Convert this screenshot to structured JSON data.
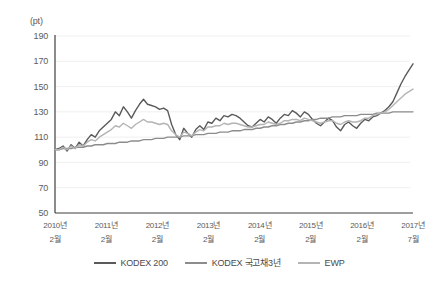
{
  "chart_data": {
    "type": "line",
    "title": "",
    "subtitle": "",
    "unit_label": "(pt)",
    "xlabel": "",
    "ylabel": "",
    "ylim": [
      50,
      190
    ],
    "y_ticks": [
      190,
      170,
      150,
      130,
      110,
      90,
      70,
      50
    ],
    "grid": true,
    "legend_position": "bottom",
    "x_tick_labels": [
      "2010년\n2월",
      "2011년\n2월",
      "2012년\n2월",
      "2013년\n2월",
      "2014년\n2월",
      "2015년\n2월",
      "2016년\n2월",
      "2017년\n7월"
    ],
    "x_ticks_line1": [
      "2010년",
      "2011년",
      "2012년",
      "2013년",
      "2014년",
      "2015년",
      "2016년",
      "2017년"
    ],
    "x_ticks_line2": [
      "2월",
      "2월",
      "2월",
      "2월",
      "2월",
      "2월",
      "2월",
      "7월"
    ],
    "x_start": "2010-02",
    "x_end": "2017-07",
    "n_points": 90,
    "colors": {
      "kodex200": "#5a5a5a",
      "kodex_bond3y": "#8c8c8c",
      "ewp": "#b4b4b4",
      "grid": "#efefef",
      "axis": "#3f3f3f",
      "text": "#5b5b5b"
    },
    "series": [
      {
        "name": "KODEX 200",
        "color": "#5a5a5a",
        "values": [
          100,
          101,
          103,
          99,
          104,
          101,
          106,
          103,
          108,
          112,
          110,
          115,
          118,
          121,
          124,
          130,
          127,
          134,
          130,
          125,
          131,
          136,
          140,
          136,
          135,
          134,
          132,
          133,
          131,
          120,
          112,
          108,
          117,
          113,
          110,
          116,
          119,
          116,
          122,
          121,
          125,
          123,
          127,
          126,
          128,
          127,
          125,
          122,
          119,
          118,
          121,
          124,
          122,
          126,
          124,
          121,
          125,
          128,
          127,
          131,
          129,
          126,
          130,
          128,
          124,
          121,
          119,
          122,
          125,
          123,
          118,
          115,
          120,
          122,
          119,
          117,
          121,
          124,
          123,
          126,
          127,
          129,
          131,
          134,
          138,
          145,
          152,
          158,
          163,
          168
        ]
      },
      {
        "name": "KODEX 국고채3년",
        "color": "#8c8c8c",
        "values": [
          100,
          100,
          101,
          101,
          101,
          102,
          102,
          102,
          103,
          103,
          104,
          104,
          104,
          105,
          105,
          105,
          106,
          106,
          106,
          107,
          107,
          107,
          108,
          108,
          108,
          109,
          109,
          109,
          110,
          110,
          110,
          110,
          111,
          111,
          111,
          112,
          112,
          112,
          113,
          113,
          113,
          114,
          114,
          114,
          115,
          115,
          115,
          116,
          116,
          116,
          117,
          117,
          118,
          118,
          119,
          119,
          120,
          120,
          121,
          121,
          122,
          122,
          123,
          123,
          124,
          124,
          125,
          125,
          125,
          126,
          126,
          126,
          127,
          127,
          127,
          127,
          128,
          128,
          128,
          128,
          129,
          129,
          129,
          129,
          130,
          130,
          130,
          130,
          130,
          130
        ]
      },
      {
        "name": "EWP",
        "color": "#b4b4b4",
        "values": [
          100,
          100,
          102,
          100,
          103,
          101,
          104,
          103,
          106,
          108,
          107,
          110,
          112,
          114,
          116,
          119,
          118,
          121,
          119,
          117,
          120,
          122,
          124,
          122,
          122,
          121,
          120,
          121,
          120,
          115,
          112,
          110,
          114,
          113,
          111,
          114,
          116,
          115,
          118,
          118,
          119,
          119,
          121,
          120,
          121,
          121,
          120,
          119,
          118,
          118,
          119,
          120,
          120,
          122,
          121,
          120,
          121,
          123,
          123,
          124,
          124,
          123,
          125,
          124,
          123,
          122,
          121,
          122,
          123,
          123,
          121,
          120,
          122,
          123,
          122,
          122,
          123,
          125,
          125,
          127,
          128,
          129,
          130,
          132,
          135,
          138,
          141,
          144,
          146,
          148
        ]
      }
    ],
    "legend": [
      {
        "label": "KODEX 200",
        "color": "#5a5a5a"
      },
      {
        "label": "KODEX 국고채3년",
        "color": "#8c8c8c"
      },
      {
        "label": "EWP",
        "color": "#b4b4b4"
      }
    ]
  }
}
